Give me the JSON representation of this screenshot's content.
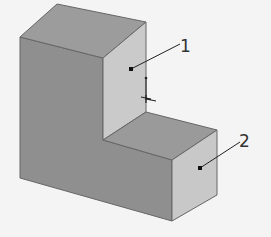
{
  "figure": {
    "callouts": [
      {
        "label": "1",
        "target": "upper vertical face"
      },
      {
        "label": "2",
        "target": "lower right face"
      }
    ]
  },
  "colors": {
    "background": "#f4f4f4",
    "top_face": "#9a9a9a",
    "front_face": "#8f8f8f",
    "right_face_light": "#c9c9c9",
    "step_top": "#9c9c9c",
    "edge": "#555555",
    "leader": "#222222"
  }
}
